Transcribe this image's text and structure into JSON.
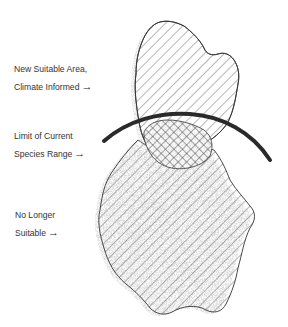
{
  "diagram": {
    "type": "range-shift-illustration",
    "labels": [
      {
        "id": "new-suitable-area",
        "lines": [
          "New Suitable Area,",
          "Climate Informed"
        ],
        "arrow": "→"
      },
      {
        "id": "limit-current-range",
        "lines": [
          "Limit of Current",
          "Species Range"
        ],
        "arrow": "→"
      },
      {
        "id": "no-longer-suitable",
        "lines": [
          "No Longer",
          "Suitable"
        ],
        "arrow": "→"
      }
    ],
    "regions": [
      {
        "name": "new-suitable-area",
        "fill": "diagonal-hatch"
      },
      {
        "name": "overlap-area",
        "fill": "cross-hatch"
      },
      {
        "name": "no-longer-suitable-area",
        "fill": "diagonal-hatch"
      }
    ],
    "boundary": {
      "name": "limit-of-current-species-range",
      "style": "thick-arc"
    },
    "colors": {
      "ink": "#2a2a2a",
      "hatch": "#555555",
      "shadow": "#6b6b6b",
      "background": "#ffffff"
    }
  }
}
